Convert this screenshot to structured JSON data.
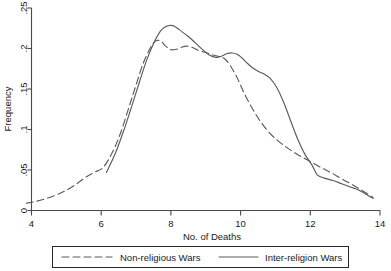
{
  "chart_data": {
    "type": "line",
    "title": "",
    "xlabel": "No. of Deaths",
    "ylabel": "Frequency",
    "xlim": [
      4,
      14
    ],
    "ylim": [
      0,
      0.25
    ],
    "xticks": [
      "4",
      "6",
      "8",
      "10",
      "12",
      "14"
    ],
    "xtick_values": [
      4,
      6,
      8,
      10,
      12,
      14
    ],
    "yticks": [
      "0",
      ".05",
      ".1",
      ".15",
      ".2",
      ".25"
    ],
    "ytick_values": [
      0,
      0.05,
      0.1,
      0.15,
      0.2,
      0.25
    ],
    "grid": false,
    "legend_position": "below",
    "series": [
      {
        "name": "Non-religious Wars",
        "style": "dashed",
        "color": "#5a5a5a",
        "x": [
          3.85,
          4.1,
          4.4,
          4.7,
          5.0,
          5.3,
          5.55,
          5.8,
          6.05,
          6.3,
          6.55,
          6.8,
          7.0,
          7.2,
          7.4,
          7.55,
          7.7,
          7.85,
          8.0,
          8.15,
          8.3,
          8.45,
          8.6,
          8.8,
          9.0,
          9.2,
          9.4,
          9.55,
          9.7,
          9.9,
          10.1,
          10.35,
          10.6,
          10.85,
          11.1,
          11.35,
          11.6,
          11.85,
          12.1,
          12.35,
          12.6,
          12.9,
          13.2,
          13.5,
          13.8
        ],
        "y": [
          0.009,
          0.011,
          0.0145,
          0.019,
          0.025,
          0.033,
          0.041,
          0.047,
          0.053,
          0.07,
          0.095,
          0.128,
          0.155,
          0.181,
          0.2,
          0.209,
          0.2095,
          0.203,
          0.1985,
          0.199,
          0.2015,
          0.203,
          0.2015,
          0.1975,
          0.195,
          0.192,
          0.19,
          0.187,
          0.179,
          0.164,
          0.145,
          0.125,
          0.108,
          0.095,
          0.085,
          0.077,
          0.07,
          0.064,
          0.058,
          0.052,
          0.0465,
          0.039,
          0.032,
          0.0245,
          0.016
        ]
      },
      {
        "name": "Inter-religion Wars",
        "style": "solid",
        "color": "#5a5a5a",
        "x": [
          6.15,
          6.4,
          6.65,
          6.9,
          7.1,
          7.3,
          7.5,
          7.7,
          7.85,
          8.0,
          8.1,
          8.25,
          8.4,
          8.55,
          8.7,
          8.9,
          9.1,
          9.3,
          9.45,
          9.6,
          9.75,
          9.9,
          10.05,
          10.2,
          10.35,
          10.5,
          10.65,
          10.85,
          11.05,
          11.25,
          11.45,
          11.65,
          11.85,
          12.05,
          12.2,
          12.4,
          12.65,
          12.9,
          13.15,
          13.4,
          13.8
        ],
        "y": [
          0.047,
          0.07,
          0.099,
          0.132,
          0.159,
          0.185,
          0.206,
          0.2215,
          0.227,
          0.2285,
          0.2275,
          0.223,
          0.218,
          0.213,
          0.207,
          0.199,
          0.192,
          0.189,
          0.1905,
          0.1935,
          0.1945,
          0.193,
          0.188,
          0.1815,
          0.176,
          0.172,
          0.169,
          0.163,
          0.151,
          0.132,
          0.109,
          0.087,
          0.069,
          0.056,
          0.044,
          0.04,
          0.037,
          0.033,
          0.029,
          0.025,
          0.015
        ]
      }
    ]
  },
  "legend": {
    "entries": [
      {
        "label": "Non-religious Wars",
        "style": "dashed"
      },
      {
        "label": "Inter-religion Wars",
        "style": "solid"
      }
    ]
  }
}
